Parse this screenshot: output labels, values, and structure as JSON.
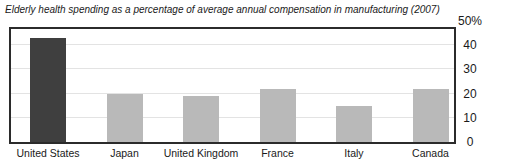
{
  "chart_data": {
    "type": "bar",
    "title": "Elderly health spending as a percentage of average annual compensation in manufacturing (2007)",
    "categories": [
      "United States",
      "Japan",
      "United Kingdom",
      "France",
      "Italy",
      "Canada"
    ],
    "values": [
      43,
      20,
      19,
      22,
      15,
      22
    ],
    "highlight_category": "United States",
    "xlabel": "",
    "ylabel": "",
    "ylim": [
      0,
      50
    ],
    "yticks": [
      50,
      40,
      30,
      20,
      10,
      0
    ],
    "ytick_labels": [
      "50%",
      "40",
      "30",
      "20",
      "10",
      "0"
    ],
    "gridlines": [
      10,
      20,
      30,
      40
    ],
    "grid": true,
    "axis_side": "right",
    "legend": "none",
    "colors": {
      "highlight_bar": "#3f3f3f",
      "bar": "#b9b9b9",
      "plot_border": "#2b2b2b",
      "gridline": "#e3e3e3",
      "text": "#1a1a1a"
    }
  }
}
